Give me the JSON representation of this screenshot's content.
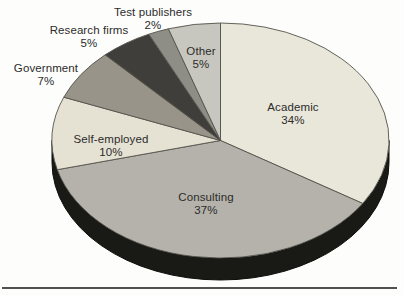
{
  "chart_data": {
    "type": "pie",
    "style": "3d",
    "title": "",
    "legend_position": "none",
    "labels_position": "outside-top, inside-bottom",
    "categories": [
      "Academic",
      "Consulting",
      "Self-employed",
      "Government",
      "Research firms",
      "Test publishers",
      "Other"
    ],
    "values": [
      34,
      37,
      10,
      7,
      5,
      2,
      5
    ],
    "slices": [
      {
        "id": "academic",
        "label": "Academic",
        "pct": 34,
        "pct_label": "34%",
        "color": "#e9e6da"
      },
      {
        "id": "consulting",
        "label": "Consulting",
        "pct": 37,
        "pct_label": "37%",
        "color": "#b4b2aa"
      },
      {
        "id": "self-employed",
        "label": "Self-employed",
        "pct": 10,
        "pct_label": "10%",
        "color": "#e5e2d4"
      },
      {
        "id": "government",
        "label": "Government",
        "pct": 7,
        "pct_label": "7%",
        "color": "#98948a"
      },
      {
        "id": "research-firms",
        "label": "Research firms",
        "pct": 5,
        "pct_label": "5%",
        "color": "#403e3a"
      },
      {
        "id": "test-publishers",
        "label": "Test publishers",
        "pct": 2,
        "pct_label": "2%",
        "color": "#8e8e87"
      },
      {
        "id": "other",
        "label": "Other",
        "pct": 5,
        "pct_label": "5%",
        "color": "#c8c7bf"
      }
    ],
    "layout": {
      "cx": 220.5,
      "cy": 140.5,
      "rx": 168.5,
      "ry": 117.5,
      "depth": 22,
      "start_angle_deg": 0,
      "direction": "clockwise",
      "side_color": "#191915",
      "side_edge_color": "#0d0d0a",
      "stroke_color": "#54524b"
    }
  }
}
